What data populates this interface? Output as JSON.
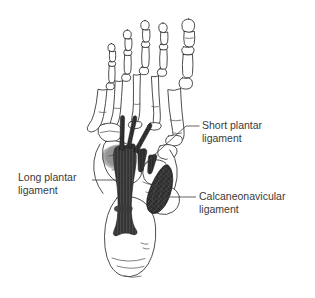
{
  "figure": {
    "background_color": "#ffffff",
    "width": 315,
    "height": 298
  },
  "labels": [
    {
      "id": "short-plantar",
      "line1": "Short plantar",
      "line2": "ligament",
      "text_color": "#3a3a3a",
      "x": 202,
      "y1": 129,
      "y2": 142
    },
    {
      "id": "long-plantar",
      "line1": "Long plantar",
      "line2": "ligament",
      "text_color": "#3a3a3a",
      "x": 18,
      "y1": 181,
      "y2": 194
    },
    {
      "id": "calcaneonavicular",
      "line1": "Calcaneonavicular",
      "line2": "ligament",
      "text_color": "#3a3a3a",
      "x": 199,
      "y1": 200,
      "y2": 213
    }
  ],
  "structures": {
    "long_plantar_ligament": {
      "name": "Long plantar ligament",
      "fill_color": "#3b3b3b",
      "description": "Broad dark band running from calcaneus forward with fanning slips to metatarsal bases"
    },
    "short_plantar_ligament": {
      "name": "Short plantar ligament",
      "fill_color": "#2b2b2b",
      "description": "Deep slips beneath the long plantar ligament"
    },
    "calcaneonavicular_ligament": {
      "name": "Calcaneonavicular ligament",
      "fill_color": "#353535",
      "description": "Teardrop shaped spring ligament medial to the long plantar ligament"
    },
    "skeleton": {
      "name": "Foot skeleton",
      "outline_color": "#2e2e2e",
      "fill_color": "#ffffff",
      "parts": [
        "phalanges",
        "metatarsals",
        "cuneiforms",
        "navicular",
        "cuboid",
        "talus",
        "calcaneus"
      ]
    }
  }
}
